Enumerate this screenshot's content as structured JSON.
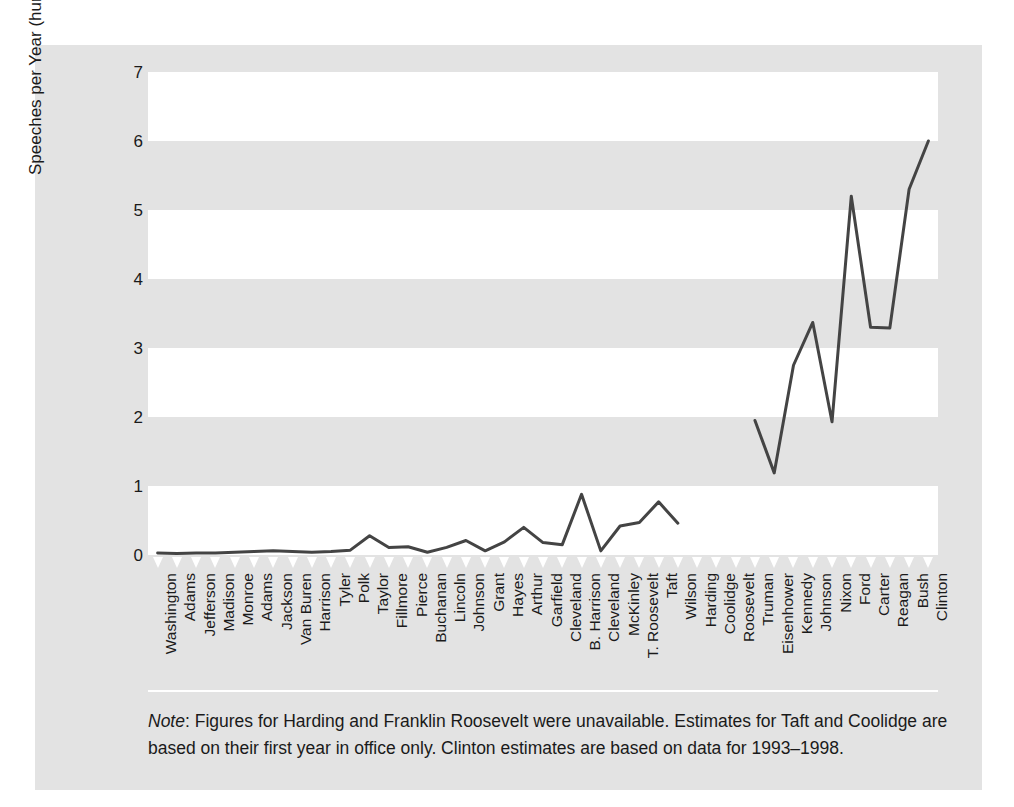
{
  "chart_data": {
    "type": "line",
    "title": "",
    "xlabel": "",
    "ylabel": "Speeches per Year (hundreds)",
    "ylim": [
      0,
      7
    ],
    "yticks": [
      0,
      1,
      2,
      3,
      4,
      5,
      6,
      7
    ],
    "grid": "alternating horizontal bands (white on 0-1, 2-3, 4-5, 6-7)",
    "legend": "none",
    "line_color": "#444444",
    "categories": [
      "Washington",
      "Adams",
      "Jefferson",
      "Madison",
      "Monroe",
      "Adams",
      "Jackson",
      "Van Buren",
      "Harrison",
      "Tyler",
      "Polk",
      "Taylor",
      "Fillmore",
      "Pierce",
      "Buchanan",
      "Lincoln",
      "Johnson",
      "Grant",
      "Hayes",
      "Arthur",
      "Garfield",
      "Cleveland",
      "B. Harrison",
      "Cleveland",
      "McKinley",
      "T. Roosevelt",
      "Taft",
      "Wilson",
      "Harding",
      "Coolidge",
      "Roosevelt",
      "Truman",
      "Eisenhower",
      "Kennedy",
      "Johnson",
      "Nixon",
      "Ford",
      "Carter",
      "Reagan",
      "Bush",
      "Clinton"
    ],
    "values": [
      0.03,
      0.02,
      0.03,
      0.03,
      0.04,
      0.05,
      0.06,
      0.05,
      0.04,
      0.05,
      0.07,
      0.28,
      0.11,
      0.12,
      0.04,
      0.11,
      0.21,
      0.06,
      0.19,
      0.4,
      0.18,
      0.15,
      0.88,
      0.06,
      0.42,
      0.47,
      0.77,
      0.46,
      null,
      0.43,
      null,
      1.95,
      1.19,
      2.75,
      3.37,
      1.93,
      5.2,
      3.3,
      3.29,
      5.3,
      6.0
    ],
    "notes_missing": [
      "Harding",
      "Roosevelt"
    ],
    "note": {
      "label": "Note",
      "text": ": Figures for Harding and Franklin Roosevelt were unavailable. Estimates for Taft and Coolidge are based on their first year in office only. Clinton estimates are based on data for 1993–1998."
    }
  }
}
